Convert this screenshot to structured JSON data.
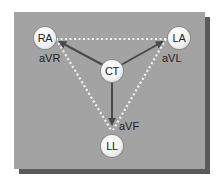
{
  "colors": {
    "background": "#ffffff",
    "panel": "#a3a3a3",
    "panel_shadow": "#5a5a5a",
    "dotted_line": "#f4f4f4",
    "arrow": "#4a4a4a",
    "node_fill": "#f5f5f5",
    "text": "#1e1e1e"
  },
  "nodes": {
    "ra": {
      "label": "RA"
    },
    "la": {
      "label": "LA"
    },
    "ct": {
      "label": "CT"
    },
    "ll": {
      "label": "LL"
    }
  },
  "leads": {
    "avr": {
      "label": "aVR"
    },
    "avl": {
      "label": "aVL"
    },
    "avf": {
      "label": "aVF"
    }
  }
}
